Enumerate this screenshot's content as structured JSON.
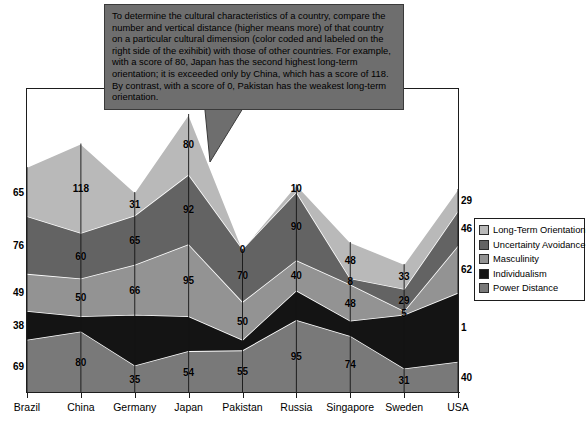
{
  "callout": {
    "text": "To determine the cultural characteristics of a country, compare the number and vertical distance (higher means more) of that country on a particular cultural dimension (color coded and labeled on the right side of the exihibit) with those of other countries.  For example, with a score of 80, Japan has the second highest long-term orientation; it is exceeded only by China, which has a score of 118.  By contrast, with a score of 0, Pakistan has the weakest long-term orientation."
  },
  "legend": {
    "items": [
      {
        "label": "Long-Term Orientation",
        "color": "#b9b9b9"
      },
      {
        "label": "Uncertainty Avoidance",
        "color": "#636363"
      },
      {
        "label": "Masculinity",
        "color": "#939393"
      },
      {
        "label": "Individualism",
        "color": "#141414"
      },
      {
        "label": "Power Distance",
        "color": "#797979"
      }
    ]
  },
  "chart_data": {
    "type": "area",
    "title": "",
    "xlabel": "",
    "ylabel": "",
    "stacked": true,
    "grid": false,
    "legend_position": "right",
    "ylim": [
      0,
      400
    ],
    "categories": [
      "Brazil",
      "China",
      "Germany",
      "Japan",
      "Pakistan",
      "Russia",
      "Singapore",
      "Sweden",
      "USA"
    ],
    "series": [
      {
        "name": "Power Distance",
        "color": "#797979",
        "values": [
          69,
          80,
          35,
          54,
          55,
          95,
          74,
          31,
          40
        ]
      },
      {
        "name": "Individualism",
        "color": "#141414",
        "values": [
          38,
          20,
          67,
          46,
          14,
          39,
          20,
          71,
          91
        ],
        "labels": [
          "38",
          "",
          "",
          "",
          "",
          "",
          "",
          "",
          "1"
        ]
      },
      {
        "name": "Masculinity",
        "color": "#939393",
        "values": [
          49,
          50,
          66,
          95,
          50,
          40,
          48,
          5,
          62
        ]
      },
      {
        "name": "Uncertainty Avoidance",
        "color": "#636363",
        "values": [
          76,
          60,
          65,
          92,
          70,
          90,
          8,
          29,
          46
        ]
      },
      {
        "name": "Long-Term Orientation",
        "color": "#b9b9b9",
        "values": [
          65,
          118,
          31,
          80,
          0,
          10,
          48,
          33,
          29
        ]
      }
    ],
    "displayed_labels": {
      "Long-Term Orientation": [
        "65",
        "118",
        "31",
        "80",
        "0",
        "10",
        "48",
        "33",
        "29"
      ],
      "Uncertainty Avoidance": [
        "76",
        "60",
        "65",
        "92",
        "70",
        "90",
        "8",
        "29",
        "46"
      ],
      "Masculinity": [
        "49",
        "50",
        "66",
        "95",
        "50",
        "40",
        "48",
        "5",
        "62"
      ],
      "Individualism": [
        "38",
        "",
        "",
        "",
        "",
        "",
        "",
        "",
        "1"
      ],
      "Power Distance": [
        "69",
        "80",
        "35",
        "54",
        "55",
        "95",
        "74",
        "31",
        "40"
      ]
    }
  }
}
